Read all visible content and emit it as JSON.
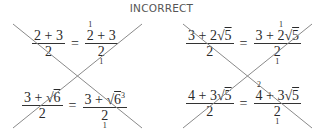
{
  "title": "INCORRECT",
  "examples": [
    {
      "lhs": {
        "num": "2 + 3",
        "den": "2"
      },
      "rhs": {
        "num_pre": "",
        "num_cancel": "2",
        "cancel_sup": "1",
        "num_post": " + 3",
        "den": "2",
        "den_sub": "1"
      }
    },
    {
      "lhs": {
        "num_a": "3 + ",
        "num_rad": "6",
        "den": "2"
      },
      "rhs": {
        "num_a": "3 + ",
        "num_rad": "6",
        "num_exp": "3",
        "den": "2",
        "den_sub": "1"
      }
    },
    {
      "lhs": {
        "num_a": "3 + 2",
        "num_rad": "5",
        "den": "2"
      },
      "rhs": {
        "num_pre": "3 + ",
        "num_cancel": "2",
        "cancel_sup": "1",
        "num_rad": "5",
        "den": "2",
        "den_sub": "1"
      }
    },
    {
      "lhs": {
        "num_a": "4 + 3",
        "num_rad": "5",
        "den": "2"
      },
      "rhs": {
        "num_cancel": "4",
        "cancel_sup": "2",
        "num_post": " + 3",
        "num_rad": "5",
        "den": "2",
        "den_sub": "1"
      }
    }
  ],
  "symbols": {
    "equals": "=",
    "sqrt": "√"
  },
  "colors": {
    "cross_line": "#8a8a8a",
    "text": "#2a2a2a",
    "title": "#555555"
  }
}
